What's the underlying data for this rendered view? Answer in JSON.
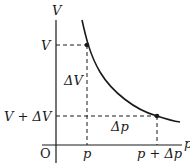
{
  "diagram": {
    "title": "",
    "axes": {
      "y_label": "V",
      "x_label": "p",
      "origin_label": "O"
    },
    "y_ticks": {
      "upper": "V",
      "lower": "V + ΔV"
    },
    "x_ticks": {
      "left": "p",
      "right": "p + Δp"
    },
    "annotations": {
      "delta_v": "ΔV",
      "delta_p": "Δp"
    },
    "curve": {
      "description": "decreasing hyperbola-like curve V vs p",
      "points": [
        {
          "name": "point-p-V",
          "p": "p",
          "V": "V"
        },
        {
          "name": "point-p-plus-dp",
          "p": "p + Δp",
          "V": "V + ΔV"
        }
      ]
    },
    "colors": {
      "line": "#1a1a1a",
      "background": "#ffffff"
    }
  }
}
